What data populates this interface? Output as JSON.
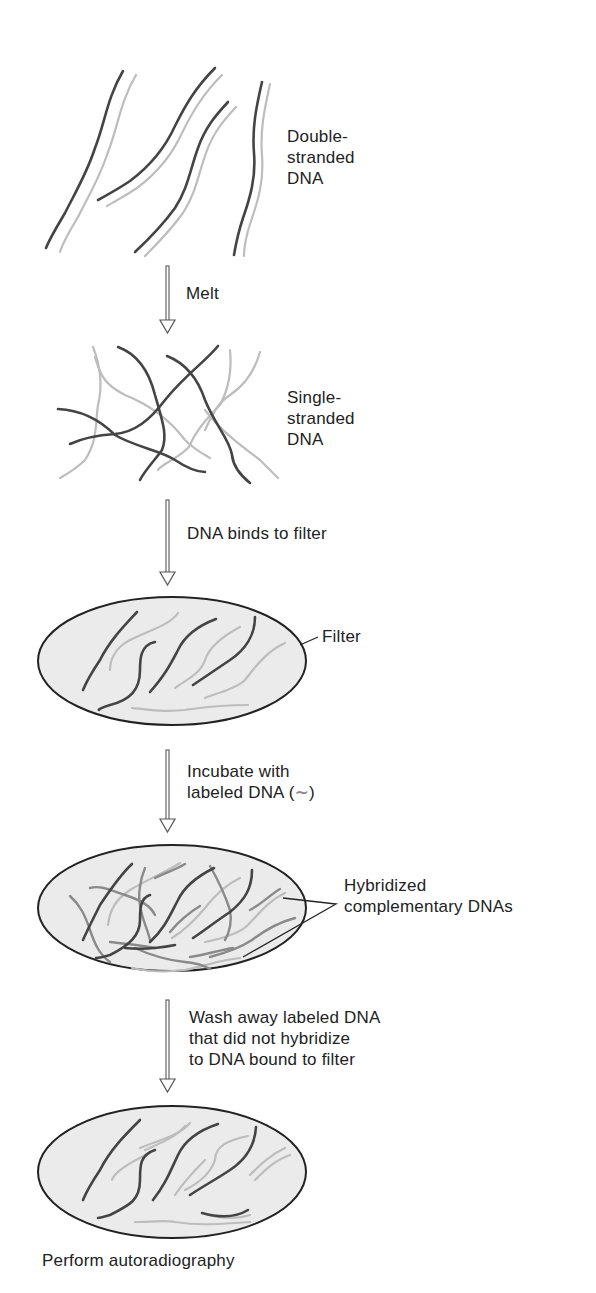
{
  "figure": {
    "type": "process-flow",
    "colors": {
      "original_strand": "#444444",
      "complementary_strand": "#bdbdbd",
      "labeled_strand": "#8a8a8a",
      "filter_fill": "#ebebeb",
      "text": "#222222"
    },
    "stages": [
      {
        "id": "double-stranded",
        "label": "Double-\nstranded\nDNA"
      },
      {
        "id": "single-stranded",
        "label": "Single-\nstranded\nDNA"
      },
      {
        "id": "filter",
        "label": "Filter"
      },
      {
        "id": "hybridized",
        "label": "Hybridized\ncomplementary DNAs"
      },
      {
        "id": "washed",
        "label": ""
      }
    ],
    "steps": [
      {
        "label": "Melt"
      },
      {
        "label": "DNA binds to filter"
      },
      {
        "label": "Incubate with\nlabeled DNA (",
        "symbol": "~",
        "suffix": ")"
      },
      {
        "label": "Wash away labeled DNA\nthat did not hybridize\nto DNA bound to filter"
      }
    ],
    "final_step": "Perform autoradiography"
  }
}
